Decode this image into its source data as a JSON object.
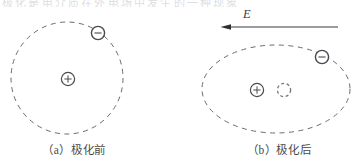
{
  "figure": {
    "top_partial_text": "极化是电介质在外电场中发生的一种现象",
    "stroke_color": "#6b6b72",
    "dark_stroke_color": "#3a3a3a",
    "background": "#ffffff",
    "panels": [
      {
        "id": "panel-a",
        "caption": "（a）极化前",
        "orbit": {
          "shape": "circle",
          "cx": 67,
          "cy": 78,
          "rx": 56,
          "ry": 56,
          "dashed": true
        },
        "positive_charge": {
          "label": "+",
          "cx": 68,
          "cy": 79,
          "r": 7,
          "dashed": false
        },
        "negative_charge": {
          "label": "−",
          "cx": 98,
          "cy": 33,
          "r": 7,
          "dashed": false
        }
      },
      {
        "id": "panel-b",
        "caption": "（b）极化后",
        "orbit": {
          "shape": "ellipse",
          "cx": 276,
          "cy": 89,
          "rx": 74,
          "ry": 44,
          "dashed": true
        },
        "positive_charge": {
          "label": "+",
          "cx": 257,
          "cy": 90,
          "r": 7,
          "dashed": false
        },
        "charge_center_ghost": {
          "label": "",
          "cx": 284,
          "cy": 90,
          "r": 7,
          "dashed": true
        },
        "negative_charge": {
          "label": "−",
          "cx": 322,
          "cy": 57,
          "r": 7,
          "dashed": false
        },
        "field_arrow": {
          "label": "E",
          "direction": "left",
          "x_start": 338,
          "x_end": 222,
          "y": 27
        }
      }
    ]
  }
}
